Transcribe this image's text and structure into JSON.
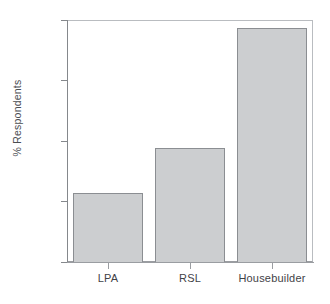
{
  "chart_data": {
    "type": "bar",
    "title": "",
    "subtitle": "",
    "xlabel": "",
    "ylabel": "% Respondents",
    "categories": [
      "LPA",
      "RSL",
      "Housebuilder"
    ],
    "values": [
      28.5,
      47.0,
      96.5
    ],
    "series": [
      {
        "name": "% Respondents",
        "values": [
          28.5,
          47.0,
          96.5
        ]
      }
    ],
    "ylim": [
      0.0,
      100.0
    ],
    "ytick_labels": [
      "0.0",
      "25.0",
      "50.0",
      "75.0",
      "100.0"
    ],
    "ytick_values": [
      0.0,
      25.0,
      50.0,
      75.0,
      100.0
    ],
    "grid": false,
    "legend": false,
    "legend_position": "none",
    "bar_fill_color": "#ccced0",
    "bar_edge_color": "#8b8e92",
    "axis_color": "#85888c",
    "background_color": "#ffffff",
    "text_color": "#4a4d51"
  },
  "axes": {
    "y_title": "% Respondents",
    "ticks_y": [
      {
        "label": "100.0",
        "value": 100.0
      },
      {
        "label": "75.0",
        "value": 75.0
      },
      {
        "label": "50.0",
        "value": 50.0
      },
      {
        "label": "25.0",
        "value": 25.0
      },
      {
        "label": "0.0",
        "value": 0.0
      }
    ],
    "ticks_x": [
      {
        "label": "LPA",
        "value": 28.5
      },
      {
        "label": "RSL",
        "value": 47.0
      },
      {
        "label": "Housebuilder",
        "value": 96.5
      }
    ]
  }
}
